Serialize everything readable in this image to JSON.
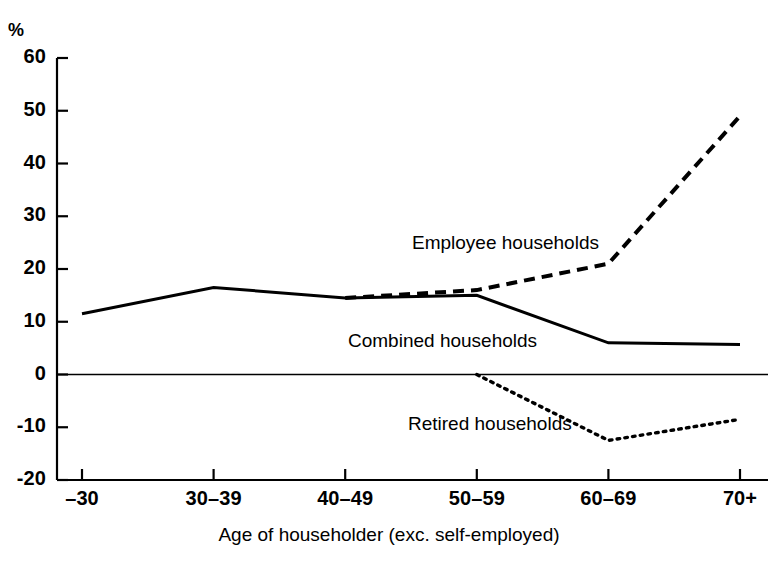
{
  "chart_data": {
    "type": "line",
    "title": "",
    "subtitle": "",
    "xlabel": "Age of householder (exc. self-employed)",
    "ylabel": "%",
    "unit": "%",
    "categories": [
      "–30",
      "30–39",
      "40–49",
      "50–59",
      "60–69",
      "70+"
    ],
    "ylim": [
      -20,
      60
    ],
    "yticks": [
      60,
      50,
      40,
      30,
      20,
      10,
      0,
      "-10",
      "-20"
    ],
    "ytick_values": [
      60,
      50,
      40,
      30,
      20,
      10,
      0,
      -10,
      -20
    ],
    "grid": false,
    "legend_position": "inline-annotations",
    "zero_line": true,
    "series": [
      {
        "name": "Employee households",
        "style": "dashed",
        "color": "#000000",
        "values": [
          null,
          null,
          14.5,
          16.0,
          21.0,
          49.0
        ],
        "label_x": 412,
        "label_y": 232
      },
      {
        "name": "Combined households",
        "style": "solid",
        "color": "#000000",
        "values": [
          11.5,
          16.5,
          14.5,
          15.0,
          6.0,
          5.7
        ],
        "label_x": 348,
        "label_y": 330
      },
      {
        "name": "Retired households",
        "style": "dotted",
        "color": "#000000",
        "values": [
          null,
          null,
          null,
          0.0,
          -12.5,
          -8.5
        ],
        "label_x": 408,
        "label_y": 413
      }
    ]
  },
  "axes": {
    "unit_label": "%",
    "y_tick_labels": [
      "60",
      "50",
      "40",
      "30",
      "20",
      "10",
      "0",
      "-10",
      "-20"
    ],
    "x_tick_labels": [
      "–30",
      "30–39",
      "40–49",
      "50–59",
      "60–69",
      "70+"
    ],
    "x_axis_title": "Age of householder (exc. self-employed)"
  },
  "annotations": {
    "employee": "Employee households",
    "combined": "Combined households",
    "retired": "Retired households"
  },
  "colors": {
    "background": "#ffffff",
    "ink": "#000000"
  }
}
